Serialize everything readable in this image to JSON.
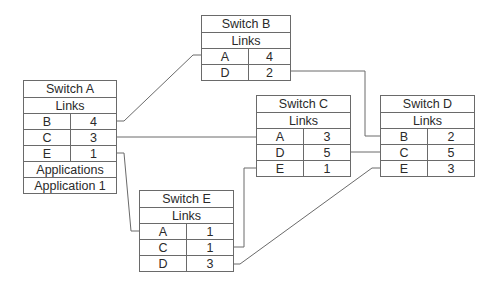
{
  "diagram": {
    "line_color": "#6a6a6a",
    "switches": {
      "a": {
        "title": "Switch A",
        "links_header": "Links",
        "links": [
          {
            "to": "B",
            "cost": "4"
          },
          {
            "to": "C",
            "cost": "3"
          },
          {
            "to": "E",
            "cost": "1"
          }
        ],
        "applications_header": "Applications",
        "applications": [
          "Application 1"
        ]
      },
      "b": {
        "title": "Switch B",
        "links_header": "Links",
        "links": [
          {
            "to": "A",
            "cost": "4"
          },
          {
            "to": "D",
            "cost": "2"
          }
        ]
      },
      "c": {
        "title": "Switch C",
        "links_header": "Links",
        "links": [
          {
            "to": "A",
            "cost": "3"
          },
          {
            "to": "D",
            "cost": "5"
          },
          {
            "to": "E",
            "cost": "1"
          }
        ]
      },
      "d": {
        "title": "Switch D",
        "links_header": "Links",
        "links": [
          {
            "to": "B",
            "cost": "2"
          },
          {
            "to": "C",
            "cost": "5"
          },
          {
            "to": "E",
            "cost": "3"
          }
        ]
      },
      "e": {
        "title": "Switch E",
        "links_header": "Links",
        "links": [
          {
            "to": "A",
            "cost": "1"
          },
          {
            "to": "C",
            "cost": "1"
          },
          {
            "to": "D",
            "cost": "3"
          }
        ]
      }
    },
    "connections": [
      {
        "from": "Switch A",
        "to": "Switch B",
        "cost": "4"
      },
      {
        "from": "Switch A",
        "to": "Switch C",
        "cost": "3"
      },
      {
        "from": "Switch A",
        "to": "Switch E",
        "cost": "1"
      },
      {
        "from": "Switch B",
        "to": "Switch D",
        "cost": "2"
      },
      {
        "from": "Switch C",
        "to": "Switch D",
        "cost": "5"
      },
      {
        "from": "Switch C",
        "to": "Switch E",
        "cost": "1"
      },
      {
        "from": "Switch E",
        "to": "Switch D",
        "cost": "3"
      }
    ]
  }
}
